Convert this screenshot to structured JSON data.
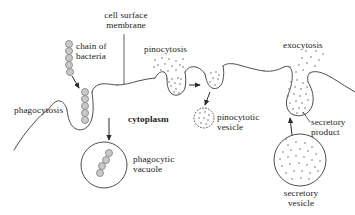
{
  "figure": {
    "background_color": "#ffffff",
    "line_color": "#3a3a3a",
    "text_color": "#1c1c1c",
    "bacteria_fill": "#c9c9c9",
    "bacteria_stroke": "#8a8a8a",
    "dot_color": "#6e6e6e"
  },
  "labels": {
    "cell_surface_membrane": "cell surface\nmembrane",
    "chain_of_bacteria": "chain of\nbacteria",
    "phagocytosis": "phagocytosis",
    "pinocytosis": "pinocytosis",
    "cytoplasm": "cytoplasm",
    "phagocytic_vacuole": "phagocytic\nvacuole",
    "pinocytotic_vesicle": "pinocytotic\nvesicle",
    "exocytosis": "exocytosis",
    "secretory_product": "secretory\nproduct",
    "secretory_vesicle": "secretory\nvesicle"
  },
  "structures": {
    "membrane": {
      "name": "cell surface membrane",
      "description": "continuous wavy line running left to right across the cell boundary with invaginations"
    },
    "phagocytosis_pocket": {
      "name": "phagocytosis invagination",
      "contents": "chain of bacteria being engulfed"
    },
    "pinocytosis_pocket": {
      "name": "pinocytosis invagination",
      "contents": "small dots (fluid droplets)"
    },
    "exocytosis_pocket": {
      "name": "exocytosis opening",
      "contents": "dots released to the exterior"
    },
    "phagocytic_vacuole": {
      "name": "phagocytic vacuole",
      "contents": "chain of bacteria",
      "bacteria_count": 4
    },
    "pinocytotic_vesicle": {
      "name": "pinocytotic vesicle",
      "contents": "dots"
    },
    "secretory_vesicle": {
      "name": "secretory vesicle",
      "contents": "dense dots (secretory product)"
    },
    "bacteria_chain_outside": {
      "name": "chain of bacteria outside cell",
      "count": 5
    },
    "bacteria_chain_entering": {
      "name": "chain of bacteria entering pocket",
      "count": 5
    }
  },
  "arrows": [
    {
      "name": "arrow-bacteria-to-membrane",
      "from": "chain of bacteria",
      "to": "phagocytosis pocket"
    },
    {
      "name": "arrow-pocket-to-vacuole",
      "from": "phagocytosis pocket",
      "to": "phagocytic vacuole"
    },
    {
      "name": "arrow-pinocytosis-to-droplet",
      "from": "pinocytosis pocket",
      "to": "pinching vesicle"
    },
    {
      "name": "arrow-droplet-to-vesicle",
      "from": "pinching vesicle",
      "to": "pinocytotic vesicle"
    },
    {
      "name": "arrow-secretory-vesicle-to-membrane",
      "from": "secretory vesicle",
      "to": "exocytosis opening"
    }
  ]
}
